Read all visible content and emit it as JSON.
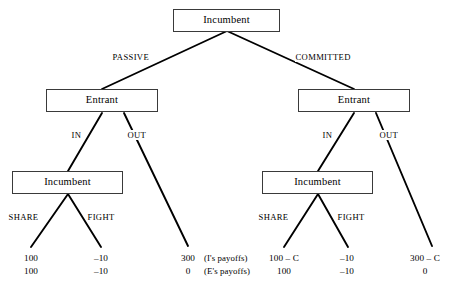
{
  "figure": {
    "type": "game-tree",
    "domain": "extensive-form game / entry deterrence",
    "background_color": "#ffffff",
    "line_color": "#000000",
    "box_border_color": "#3a3a3a"
  },
  "nodes": {
    "root": {
      "label": "Incumbent",
      "player": "I"
    },
    "entrant_left": {
      "label": "Entrant",
      "player": "E"
    },
    "entrant_right": {
      "label": "Entrant",
      "player": "E"
    },
    "incumbent_left": {
      "label": "Incumbent",
      "player": "I"
    },
    "incumbent_right": {
      "label": "Incumbent",
      "player": "I"
    }
  },
  "actions": {
    "root_left": "PASSIVE",
    "root_right": "COMMITTED",
    "entrant_left_in": "IN",
    "entrant_left_out": "OUT",
    "entrant_right_in": "IN",
    "entrant_right_out": "OUT",
    "incumbent_left_share": "SHARE",
    "incumbent_left_fight": "FIGHT",
    "incumbent_right_share": "SHARE",
    "incumbent_right_fight": "FIGHT"
  },
  "payoff_row_labels": {
    "incumbent": "(I's payoffs)",
    "entrant": "(E's payoffs)"
  },
  "terminals": [
    {
      "id": "t1",
      "path": "PASSIVE / IN / SHARE",
      "incumbent": "100",
      "entrant": "100"
    },
    {
      "id": "t2",
      "path": "PASSIVE / IN / FIGHT",
      "incumbent": "–10",
      "entrant": "–10"
    },
    {
      "id": "t3",
      "path": "PASSIVE / OUT",
      "incumbent": "300",
      "entrant": "0"
    },
    {
      "id": "t4",
      "path": "COMMITTED / IN / SHARE",
      "incumbent": "100 – C",
      "entrant": "100"
    },
    {
      "id": "t5",
      "path": "COMMITTED / IN / FIGHT",
      "incumbent": "–10",
      "entrant": "–10"
    },
    {
      "id": "t6",
      "path": "COMMITTED / OUT",
      "incumbent": "300 – C",
      "entrant": "0"
    }
  ]
}
